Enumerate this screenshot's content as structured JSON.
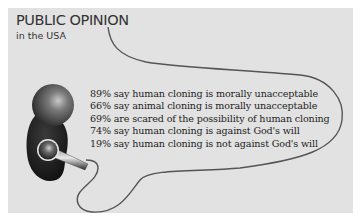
{
  "header": {
    "title": "PUBLIC OPINION",
    "subtitle": "in the USA"
  },
  "illustration": {
    "icon": "microphone-icon",
    "description": "microphone with cord forming a speech bubble"
  },
  "statements": [
    {
      "percent": "89%",
      "text": "say human cloning is morally unacceptable"
    },
    {
      "percent": "66%",
      "text": "say animal cloning is morally unacceptable"
    },
    {
      "percent": "69%",
      "text": "are scared of the possibility of human cloning"
    },
    {
      "percent": "74%",
      "text": "say human cloning is against God's will"
    },
    {
      "percent": "19%",
      "text": "say human cloning is not against God's will"
    }
  ],
  "colors": {
    "panel": "#e2e2e2",
    "text": "#222222",
    "cord": "#555555"
  }
}
